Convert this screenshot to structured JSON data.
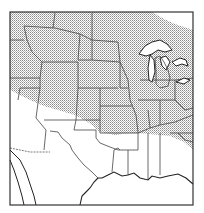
{
  "map": {
    "subject": "Range map of central and eastern United States",
    "region": "Contiguous United States (central/northern portion)",
    "legend": [],
    "shaded_area": "Diagonal band from northwestern states through Great Plains, Midwest and Great Lakes region to Kentucky/Tennessee",
    "colors": {
      "frame": "#333333",
      "borders": "#444444",
      "shading_dot": "#8a8a8a",
      "background": "#ffffff"
    }
  }
}
